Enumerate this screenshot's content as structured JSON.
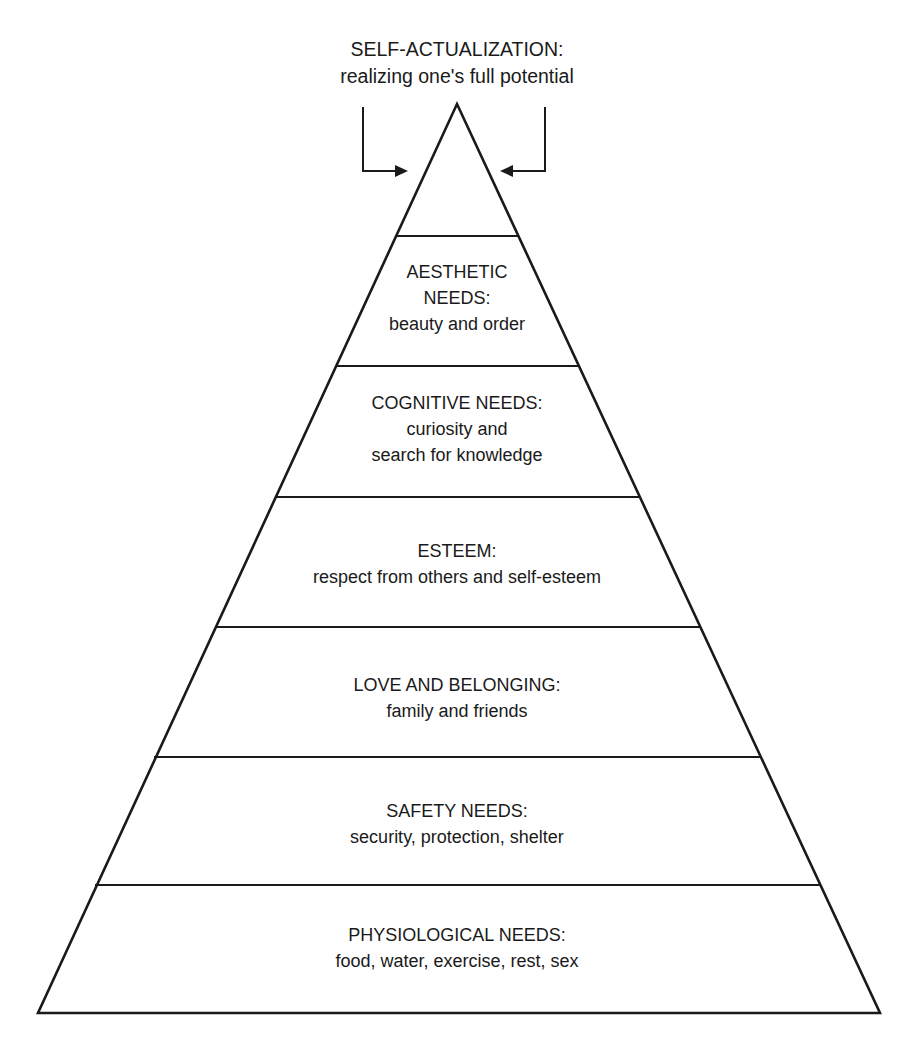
{
  "diagram": {
    "type": "hierarchy-pyramid",
    "apex_label": {
      "title": "SELF-ACTUALIZATION:",
      "description": "realizing one's full potential"
    },
    "levels": [
      {
        "id": "aesthetic",
        "lines": [
          "AESTHETIC",
          "NEEDS:",
          "beauty and order"
        ]
      },
      {
        "id": "cognitive",
        "lines": [
          "COGNITIVE NEEDS:",
          "curiosity and",
          "search for knowledge"
        ]
      },
      {
        "id": "esteem",
        "lines": [
          "ESTEEM:",
          "respect from others and self-esteem"
        ]
      },
      {
        "id": "love",
        "lines": [
          "LOVE AND BELONGING:",
          "family and friends"
        ]
      },
      {
        "id": "safety",
        "lines": [
          "SAFETY NEEDS:",
          "security, protection, shelter"
        ]
      },
      {
        "id": "physiological",
        "lines": [
          "PHYSIOLOGICAL NEEDS:",
          "food, water, exercise, rest, sex"
        ]
      }
    ],
    "colors": {
      "stroke": "#1a1a1a",
      "background": "#ffffff"
    }
  }
}
